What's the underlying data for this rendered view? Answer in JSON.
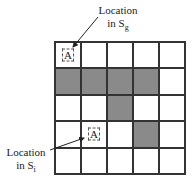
{
  "labels": {
    "top": {
      "line1": "Location",
      "line2": "in S",
      "sub": "g"
    },
    "bottom": {
      "line1": "Location",
      "line2": "in S",
      "sub": "i"
    }
  },
  "grid": {
    "rows": 5,
    "cols": 5,
    "shaded_color": "#8a8a8a",
    "cells": [
      [
        {
          "shaded": false,
          "marker": "A"
        },
        {
          "shaded": false
        },
        {
          "shaded": false
        },
        {
          "shaded": false
        },
        {
          "shaded": false
        }
      ],
      [
        {
          "shaded": true
        },
        {
          "shaded": true
        },
        {
          "shaded": true
        },
        {
          "shaded": true
        },
        {
          "shaded": false
        }
      ],
      [
        {
          "shaded": false
        },
        {
          "shaded": false
        },
        {
          "shaded": true
        },
        {
          "shaded": false
        },
        {
          "shaded": false
        }
      ],
      [
        {
          "shaded": false
        },
        {
          "shaded": false,
          "marker": "A"
        },
        {
          "shaded": false
        },
        {
          "shaded": true
        },
        {
          "shaded": false
        }
      ],
      [
        {
          "shaded": false
        },
        {
          "shaded": false
        },
        {
          "shaded": false
        },
        {
          "shaded": false
        },
        {
          "shaded": false
        }
      ]
    ]
  },
  "markers": {
    "top": "A",
    "bottom": "A"
  }
}
